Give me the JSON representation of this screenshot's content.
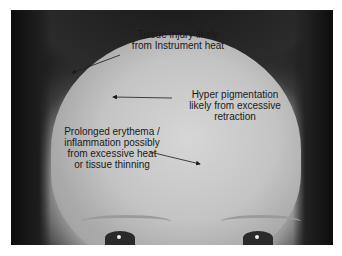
{
  "image": {
    "description": "Grayscale clinical photograph of a forehead with annotations",
    "background_color": "#ffffff"
  },
  "annotations": [
    {
      "id": "tissue-injury",
      "text": "Tissue injury likely\nfrom Instrument heat",
      "arrow_from": [
        120,
        55
      ],
      "arrow_to": [
        72,
        73
      ]
    },
    {
      "id": "hyper-pigmentation",
      "text": "Hyper pigmentation\nlikely from excessive\nretraction",
      "arrow_from": [
        172,
        98
      ],
      "arrow_to": [
        113,
        97
      ]
    },
    {
      "id": "prolonged-erythema",
      "text": "Prolonged erythema /\ninflammation possibly\nfrom excessive heat\nor tissue thinning",
      "arrow_from": [
        150,
        152
      ],
      "arrow_to": [
        200,
        164
      ]
    }
  ],
  "annotation_color": "#1a1a1a"
}
